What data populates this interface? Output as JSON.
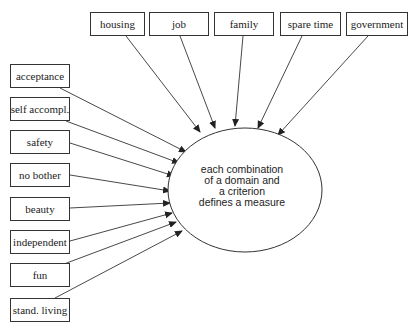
{
  "domains": [
    {
      "label": "housing",
      "x": 90,
      "y": 12,
      "w": 54,
      "h": 23,
      "end": [
        200,
        132
      ]
    },
    {
      "label": "job",
      "x": 149,
      "y": 12,
      "w": 59,
      "h": 23,
      "end": [
        215,
        128
      ]
    },
    {
      "label": "family",
      "x": 214,
      "y": 12,
      "w": 59,
      "h": 23,
      "end": [
        235,
        126
      ]
    },
    {
      "label": "spare time",
      "x": 280,
      "y": 12,
      "w": 60,
      "h": 23,
      "end": [
        258,
        128
      ]
    },
    {
      "label": "government",
      "x": 346,
      "y": 12,
      "w": 61,
      "h": 23,
      "end": [
        278,
        135
      ]
    }
  ],
  "criteria": [
    {
      "label": "acceptance",
      "x": 10,
      "y": 64,
      "w": 59,
      "h": 23,
      "end": [
        186,
        152
      ]
    },
    {
      "label": "self accompl.",
      "x": 10,
      "y": 97,
      "w": 59,
      "h": 23,
      "end": [
        179,
        163
      ]
    },
    {
      "label": "safety",
      "x": 10,
      "y": 130,
      "w": 59,
      "h": 23,
      "end": [
        174,
        176
      ]
    },
    {
      "label": "no bother",
      "x": 10,
      "y": 163,
      "w": 59,
      "h": 23,
      "end": [
        170,
        191
      ]
    },
    {
      "label": "beauty",
      "x": 10,
      "y": 197,
      "w": 59,
      "h": 23,
      "end": [
        170,
        203
      ]
    },
    {
      "label": "independent",
      "x": 10,
      "y": 230,
      "w": 59,
      "h": 23,
      "end": [
        172,
        213
      ]
    },
    {
      "label": "fun",
      "x": 10,
      "y": 263,
      "w": 59,
      "h": 23,
      "end": [
        176,
        222
      ]
    },
    {
      "label": "stand. living",
      "x": 10,
      "y": 298,
      "w": 59,
      "h": 23,
      "end": [
        182,
        231
      ]
    }
  ],
  "center": {
    "cx": 245,
    "cy": 190,
    "rx": 77,
    "ry": 62,
    "lines": [
      "each combination",
      "of a domain and",
      "a criterion",
      "defines a measure"
    ]
  },
  "colors": {
    "stroke": "#333333",
    "fill": "#ffffff",
    "text": "#222222"
  }
}
